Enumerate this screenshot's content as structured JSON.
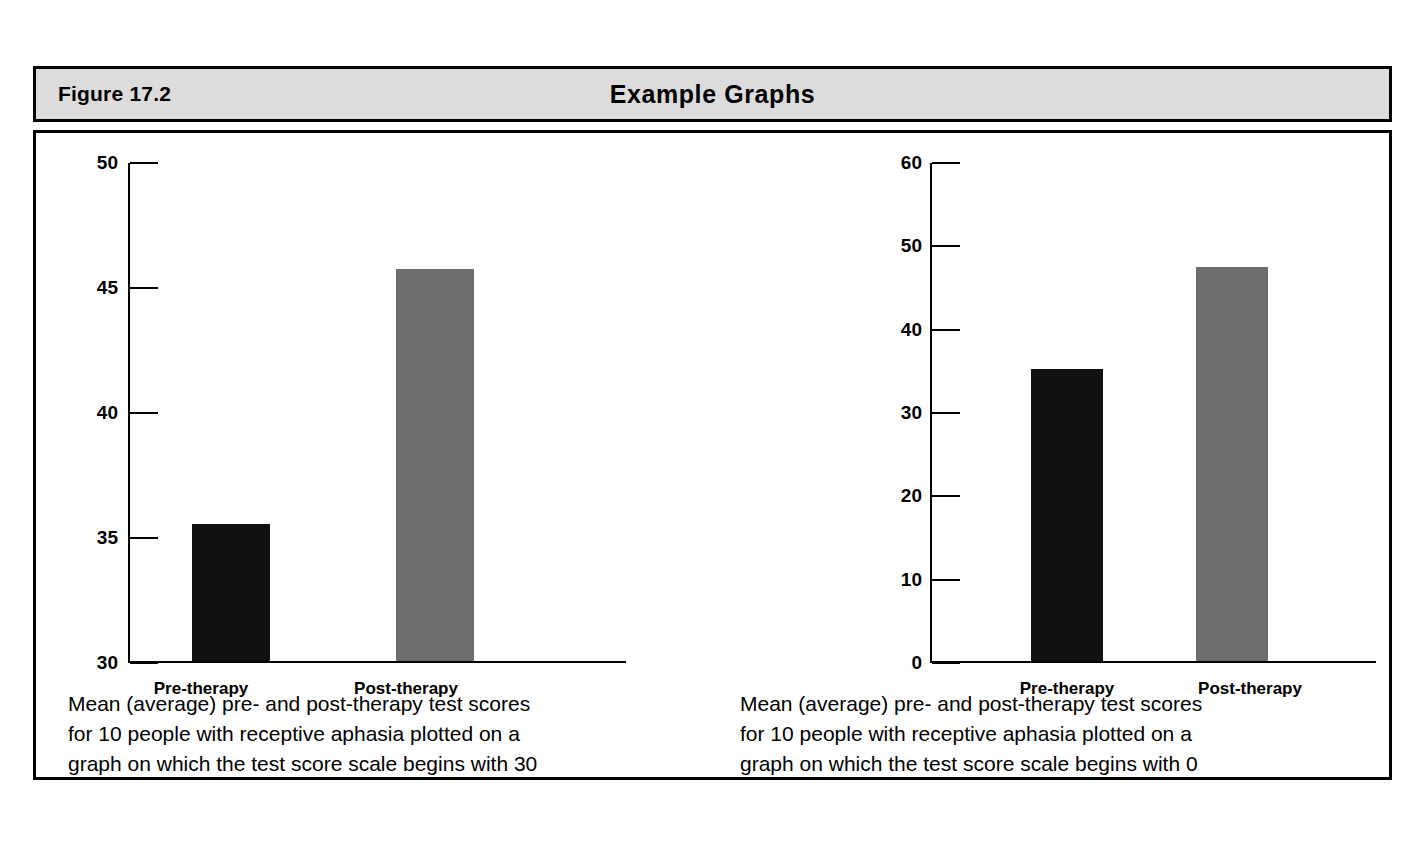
{
  "figure": {
    "number": "Figure 17.2",
    "title": "Example Graphs"
  },
  "colors": {
    "header_background": "#dcdcdc",
    "border": "#000000",
    "bar_pre": "#111111",
    "bar_post": "#6e6e6e",
    "page_background": "#ffffff"
  },
  "panels": [
    {
      "id": "left",
      "caption": "Mean (average) pre- and post-therapy test scores\nfor 10 people with receptive aphasia plotted on a\ngraph on which the test score scale begins with 30"
    },
    {
      "id": "right",
      "caption": "Mean (average) pre- and post-therapy test scores\nfor 10 people with receptive aphasia plotted on a\ngraph on which the test score scale begins with 0"
    }
  ],
  "chart_data": [
    {
      "type": "bar",
      "title": "",
      "xlabel": "",
      "ylabel": "",
      "categories": [
        "Pre-therapy",
        "Post-therapy"
      ],
      "values": [
        35.5,
        45.7
      ],
      "ylim": [
        30,
        50
      ],
      "yticks": [
        30,
        35,
        40,
        45,
        50
      ],
      "ytick_labels": [
        "30",
        "35",
        "40",
        "45",
        "50"
      ],
      "bar_colors": [
        "#111111",
        "#6e6e6e"
      ],
      "grid": false,
      "legend": "none",
      "note": "test score scale begins with 30"
    },
    {
      "type": "bar",
      "title": "",
      "xlabel": "",
      "ylabel": "",
      "categories": [
        "Pre-therapy",
        "Post-therapy"
      ],
      "values": [
        35.0,
        47.3
      ],
      "ylim": [
        0,
        60
      ],
      "yticks": [
        0,
        10,
        20,
        30,
        40,
        50,
        60
      ],
      "ytick_labels": [
        "0",
        "10",
        "20",
        "30",
        "40",
        "50",
        "60"
      ],
      "bar_colors": [
        "#111111",
        "#6e6e6e"
      ],
      "grid": false,
      "legend": "none",
      "note": "test score scale begins with 0"
    }
  ]
}
